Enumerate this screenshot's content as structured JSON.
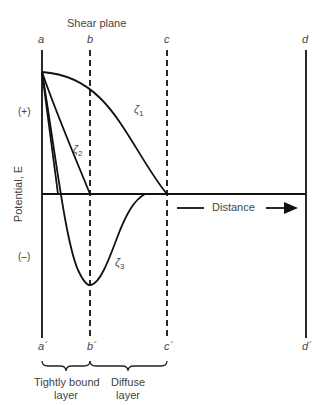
{
  "title": "Shear plane",
  "lines_top": {
    "a": "a",
    "b": "b",
    "c": "c",
    "d": "d"
  },
  "lines_bottom": {
    "a": "a´",
    "b": "b´",
    "c": "c´",
    "d": "d´"
  },
  "y_axis": {
    "label": "Potential, E",
    "positive": "(+)",
    "negative": "(–)"
  },
  "x_axis": {
    "label": "Distance"
  },
  "curves": {
    "zeta1": "ζ",
    "zeta1_sub": "1",
    "zeta2": "ζ",
    "zeta2_sub": "2",
    "zeta3": "ζ",
    "zeta3_sub": "3"
  },
  "regions": {
    "tightly_bound": {
      "line1": "Tightly bound",
      "line2": "layer"
    },
    "diffuse": {
      "line1": "Diffuse",
      "line2": "layer"
    }
  },
  "colors": {
    "line": "#111111",
    "text": "#444444"
  }
}
